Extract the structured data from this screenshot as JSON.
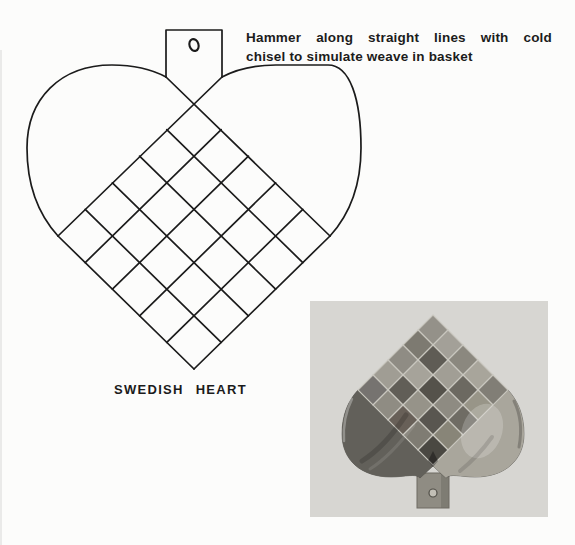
{
  "annotation": {
    "line1": "Hammer along straight lines with cold",
    "line2": "chisel to simulate weave in basket"
  },
  "caption": "SWEDISH HEART",
  "colors": {
    "ink": "#1b1b1b",
    "paper": "#fcfcfb",
    "photo_background": "#d7d6d2",
    "metal_base": "#7b786f",
    "metal_left_lobe": "#62605a",
    "metal_right_lobe": "#a9a69c",
    "metal_tab": "#8f8c83",
    "weave_gap": "#c9c7bf"
  },
  "diagram": {
    "grid_rows": 5,
    "grid_cols": 5,
    "grid": {
      "top": [
        194,
        103
      ],
      "right": [
        330,
        236
      ],
      "bottom": [
        194,
        369
      ],
      "left": [
        58,
        236
      ]
    },
    "tab": {
      "left": 166,
      "right": 222,
      "top": 30,
      "bottom": 77
    },
    "hole": {
      "cx": 194,
      "cy": 45,
      "rx": 4.5,
      "ry": 6
    }
  },
  "photo": {
    "grid": {
      "top": [
        123,
        14
      ],
      "right": [
        198,
        89
      ],
      "bottom": [
        123,
        164
      ],
      "left": [
        48,
        89
      ]
    },
    "cell_shades": [
      [
        "#949189",
        "#a3a098",
        "#8b887f",
        "#a8a59b",
        "#817e76"
      ],
      [
        "#7d7a71",
        "#5f5c55",
        "#a19e95",
        "#6c6961",
        "#989588"
      ],
      [
        "#8f8c84",
        "#a6a39a",
        "#55524b",
        "#8e8b82",
        "#6f6c64"
      ],
      [
        "#a09d94",
        "#615e57",
        "#969389",
        "#595650",
        "#888578"
      ],
      [
        "#767370",
        "#8f8c83",
        "#686058",
        "#7f7c73",
        "#4a4842"
      ]
    ]
  }
}
